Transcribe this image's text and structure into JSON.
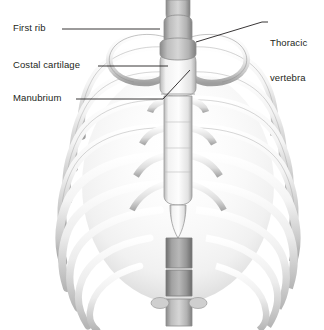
{
  "figure": {
    "background_color": "#ffffff",
    "text_color": "#231f20",
    "leader_color": "#231f20",
    "bone_light": "#ffffff",
    "bone_mid": "#d9d9d9",
    "bone_shadow": "#9a9a9a",
    "vertebra_dark": "#8d8d8d",
    "width": 324,
    "height": 330
  },
  "labels": [
    {
      "id": "first-rib",
      "text": "First rib",
      "side": "left",
      "leader": "horizontal"
    },
    {
      "id": "costal-cartilage",
      "text": "Costal cartilage",
      "side": "left",
      "leader": "horizontal"
    },
    {
      "id": "manubrium",
      "text": "Manubrium",
      "side": "left",
      "leader": "horizontal-then-diagonal"
    },
    {
      "id": "thoracic-vertebra",
      "text_line1": "Thoracic",
      "text_line2": "vertebra",
      "side": "right",
      "leader": "horizontal-then-diagonal"
    }
  ],
  "structures": [
    "first rib pair",
    "costal cartilages",
    "manubrium of sternum",
    "body of sternum",
    "xiphoid process",
    "thoracic vertebra",
    "lumbar vertebrae",
    "true ribs",
    "false ribs"
  ]
}
